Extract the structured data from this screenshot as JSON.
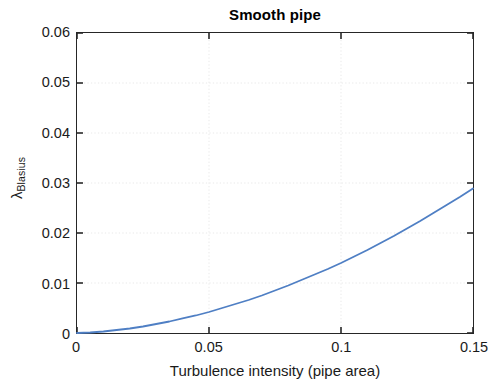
{
  "figure": {
    "title": "Smooth pipe",
    "background_color": "#ffffff",
    "axis_color": "#262626",
    "grid_color": "#e9e9e9"
  },
  "axes": {
    "xlabel": "Turbulence intensity (pipe area)",
    "ylabel_symbol": "λ",
    "ylabel_subscript": "Blasius",
    "xtick_labels": [
      "0",
      "0.05",
      "0.1",
      "0.15"
    ],
    "ytick_labels": [
      "0",
      "0.01",
      "0.02",
      "0.03",
      "0.04",
      "0.05",
      "0.06"
    ]
  },
  "chart_data": {
    "type": "line",
    "title": "Smooth pipe",
    "xlabel": "Turbulence intensity (pipe area)",
    "ylabel": "λ_Blasius",
    "xlim": [
      0,
      0.15
    ],
    "ylim": [
      0,
      0.06
    ],
    "xticks": [
      0,
      0.05,
      0.1,
      0.15
    ],
    "yticks": [
      0,
      0.01,
      0.02,
      0.03,
      0.04,
      0.05,
      0.06
    ],
    "grid": true,
    "legend": null,
    "line_color": "#4f7fc4",
    "line_width": 1.8,
    "series": [
      {
        "name": "lambda_Blasius",
        "x": [
          0,
          0.005,
          0.01,
          0.015,
          0.02,
          0.025,
          0.03,
          0.035,
          0.04,
          0.045,
          0.05,
          0.055,
          0.06,
          0.065,
          0.07,
          0.075,
          0.08,
          0.085,
          0.09,
          0.095,
          0.1,
          0.105,
          0.11,
          0.115,
          0.12,
          0.125,
          0.13,
          0.135,
          0.14,
          0.145,
          0.15
        ],
        "values": [
          0.0,
          0.0001,
          0.0003,
          0.0006,
          0.0009,
          0.0013,
          0.0018,
          0.0023,
          0.0029,
          0.0035,
          0.0042,
          0.005,
          0.0058,
          0.0066,
          0.0075,
          0.0085,
          0.0095,
          0.0106,
          0.0117,
          0.0128,
          0.014,
          0.0153,
          0.0166,
          0.018,
          0.0194,
          0.0209,
          0.0224,
          0.024,
          0.0256,
          0.0272,
          0.0289
        ]
      }
    ],
    "curve_note": "Monotonic convex power-law-like growth from 0 at x=0 to 0.0577 at x=0.15"
  }
}
